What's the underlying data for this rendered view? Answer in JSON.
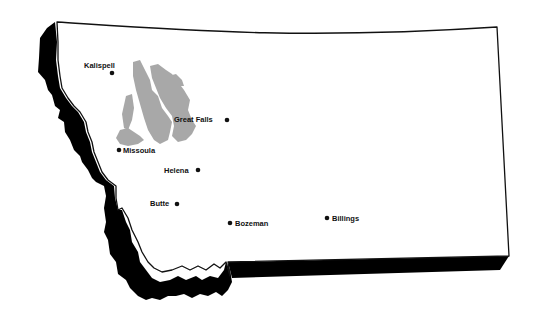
{
  "map": {
    "region": "Montana",
    "colors": {
      "background": "#ffffff",
      "land": "#ffffff",
      "outline": "#111111",
      "relief_shadow": "#000000",
      "shaded_area": "#a8a8a8",
      "city_marker": "#111111"
    },
    "shaded_area": {
      "description": "gray-shaded region in northwest Montana"
    },
    "cities": [
      {
        "name": "Kalispell",
        "x": 112,
        "y": 73,
        "label_x": 84,
        "label_y": 67
      },
      {
        "name": "Great Falls",
        "x": 227,
        "y": 120,
        "label_x": 174,
        "label_y": 122
      },
      {
        "name": "Missoula",
        "x": 119,
        "y": 150,
        "label_x": 123,
        "label_y": 153
      },
      {
        "name": "Helena",
        "x": 198,
        "y": 170,
        "label_x": 163,
        "label_y": 173
      },
      {
        "name": "Butte",
        "x": 177,
        "y": 204,
        "label_x": 149,
        "label_y": 206
      },
      {
        "name": "Bozeman",
        "x": 230,
        "y": 223,
        "label_x": 235,
        "label_y": 226
      },
      {
        "name": "Billings",
        "x": 327,
        "y": 218,
        "label_x": 332,
        "label_y": 221
      }
    ]
  }
}
